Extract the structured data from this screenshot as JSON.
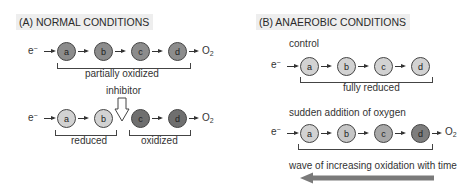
{
  "panel_a": {
    "title": "(A)  NORMAL CONDITIONS",
    "row1": {
      "input": "e",
      "carriers": [
        "a",
        "b",
        "c",
        "d"
      ],
      "output": "O",
      "output_sub": "2",
      "bracket_label": "partially oxidized"
    },
    "row2": {
      "input": "e",
      "carriers": [
        "a",
        "b",
        "c",
        "d"
      ],
      "inhibitor_label": "inhibitor",
      "output": "O",
      "output_sub": "2",
      "left_label": "reduced",
      "right_label": "oxidized"
    }
  },
  "panel_b": {
    "title": "(B)  ANAEROBIC CONDITIONS",
    "row1": {
      "caption": "control",
      "input": "e",
      "carriers": [
        "a",
        "b",
        "c",
        "d"
      ],
      "bracket_label": "fully reduced"
    },
    "row2": {
      "caption": "sudden addition of oxygen",
      "input": "e",
      "carriers": [
        "a",
        "b",
        "c",
        "d"
      ],
      "output": "O",
      "output_sub": "2"
    },
    "wave_label": "wave of increasing oxidation with time"
  },
  "colors": {
    "oxidized": "#7a7a7a",
    "partial": "#8c8c8c",
    "reduced": "#d2d2d2",
    "gradient_c": "#a8a8a8",
    "gradient_d": "#7d7d7d",
    "wave_arrow": "#7a7a7a"
  }
}
